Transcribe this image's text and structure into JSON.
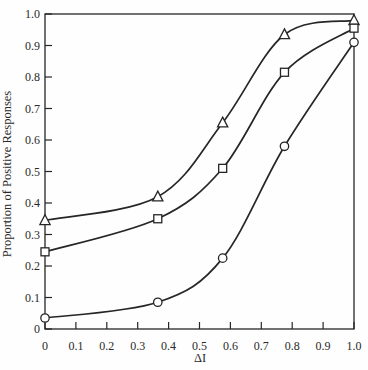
{
  "figure": {
    "background": "#fefefe",
    "ink": "#262626"
  },
  "chart_data": {
    "type": "line",
    "title": "",
    "xlabel": "ΔI",
    "ylabel": "Proportion of Positive Responses",
    "x": [
      0,
      0.365,
      0.575,
      0.775,
      1.0
    ],
    "series": [
      {
        "name": "upper-curve",
        "marker": "triangle",
        "values": [
          0.345,
          0.42,
          0.655,
          0.935,
          0.98
        ]
      },
      {
        "name": "middle-curve",
        "marker": "square",
        "values": [
          0.245,
          0.35,
          0.51,
          0.815,
          0.955
        ]
      },
      {
        "name": "lower-curve",
        "marker": "circle",
        "values": [
          0.035,
          0.085,
          0.225,
          0.58,
          0.91
        ]
      }
    ],
    "xlim": [
      0,
      1
    ],
    "ylim": [
      0,
      1
    ],
    "x_tick_values": [
      0,
      0.1,
      0.2,
      0.3,
      0.4,
      0.5,
      0.6,
      0.7,
      0.8,
      0.9,
      1.0
    ],
    "x_tick_labels": [
      "0",
      "0.1",
      "0.2",
      "0.3",
      "0.4",
      "0.5",
      "0.6",
      "0.7",
      "0.8",
      "0.9",
      "1.0"
    ],
    "y_tick_values": [
      0,
      0.1,
      0.2,
      0.3,
      0.4,
      0.5,
      0.6,
      0.7,
      0.8,
      0.9,
      1.0
    ],
    "y_tick_labels": [
      "0",
      "0.1",
      "0.2",
      "0.3",
      "0.4",
      "0.5",
      "0.6",
      "0.7",
      "0.8",
      "0.9",
      "1.0"
    ],
    "grid": false,
    "legend_position": "none",
    "line_color": "#262626",
    "marker_fill": "#ffffff"
  }
}
